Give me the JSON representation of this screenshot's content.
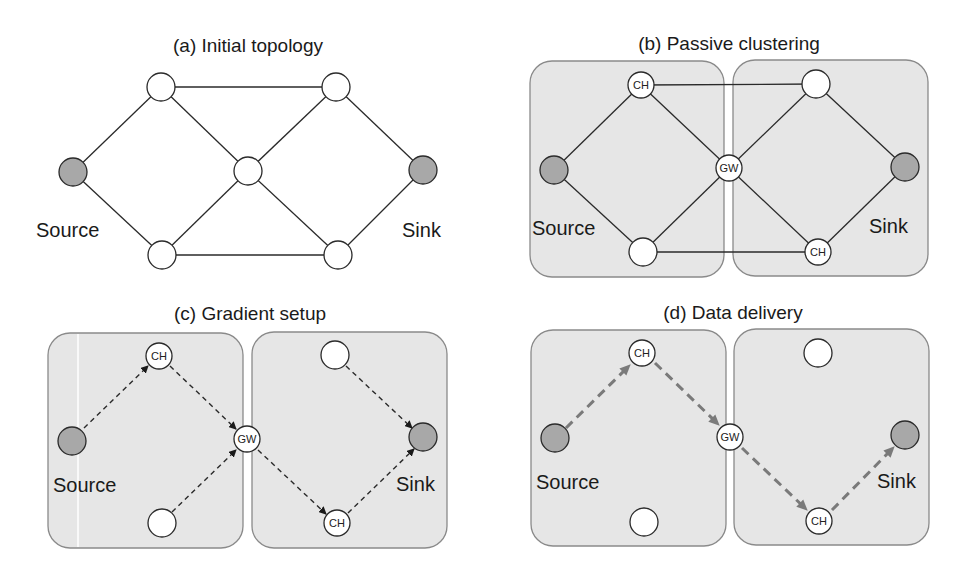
{
  "panels": [
    {
      "id": "a",
      "title": "(a) Initial topology",
      "source_label": "Source",
      "sink_label": "Sink",
      "clusters": false,
      "nodes": [
        {
          "role": "source",
          "label": ""
        },
        {
          "role": "relay",
          "label": ""
        },
        {
          "role": "relay",
          "label": ""
        },
        {
          "role": "relay",
          "label": ""
        },
        {
          "role": "relay",
          "label": ""
        },
        {
          "role": "relay",
          "label": ""
        },
        {
          "role": "sink",
          "label": ""
        }
      ],
      "edge_style": "solid"
    },
    {
      "id": "b",
      "title": "(b) Passive clustering",
      "source_label": "Source",
      "sink_label": "Sink",
      "clusters": true,
      "nodes": [
        {
          "role": "source",
          "label": ""
        },
        {
          "role": "cluster-head",
          "label": "CH"
        },
        {
          "role": "relay",
          "label": ""
        },
        {
          "role": "gateway",
          "label": "GW"
        },
        {
          "role": "relay",
          "label": ""
        },
        {
          "role": "cluster-head",
          "label": "CH"
        },
        {
          "role": "sink",
          "label": ""
        }
      ],
      "edge_style": "solid"
    },
    {
      "id": "c",
      "title": "(c) Gradient setup",
      "source_label": "Source",
      "sink_label": "Sink",
      "clusters": true,
      "nodes": [
        {
          "role": "source",
          "label": ""
        },
        {
          "role": "cluster-head",
          "label": "CH"
        },
        {
          "role": "relay",
          "label": ""
        },
        {
          "role": "gateway",
          "label": "GW"
        },
        {
          "role": "relay",
          "label": ""
        },
        {
          "role": "cluster-head",
          "label": "CH"
        },
        {
          "role": "sink",
          "label": ""
        }
      ],
      "edge_style": "dashed-arrows"
    },
    {
      "id": "d",
      "title": "(d) Data delivery",
      "source_label": "Source",
      "sink_label": "Sink",
      "clusters": true,
      "nodes": [
        {
          "role": "source",
          "label": ""
        },
        {
          "role": "cluster-head",
          "label": "CH"
        },
        {
          "role": "relay",
          "label": ""
        },
        {
          "role": "gateway",
          "label": "GW"
        },
        {
          "role": "relay",
          "label": ""
        },
        {
          "role": "cluster-head",
          "label": "CH"
        },
        {
          "role": "sink",
          "label": ""
        }
      ],
      "edge_style": "bold-dashed-path"
    }
  ],
  "colors": {
    "cluster_fill": "#e6e6e6",
    "endpoint_fill": "#a8a8a8",
    "node_fill": "#ffffff",
    "path_color": "#7a7a7a"
  }
}
